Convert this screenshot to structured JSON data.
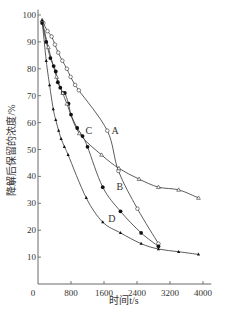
{
  "chart_data": {
    "type": "line",
    "title": "",
    "xlabel": "时间t/s",
    "ylabel": "降解后保留的浓度/%",
    "xlim": [
      0,
      4000
    ],
    "ylim": [
      0,
      100
    ],
    "x_ticks": [
      "0",
      "800",
      "1600",
      "2400",
      "3200",
      "4000"
    ],
    "y_ticks": [
      "10",
      "20",
      "30",
      "40",
      "50",
      "60",
      "70",
      "80",
      "90",
      "100"
    ],
    "grid": false,
    "legend": "inline labels",
    "series": [
      {
        "name": "A",
        "marker": "open-circle",
        "label_pos": [
          1780,
          57
        ],
        "points": [
          [
            130,
            97
          ],
          [
            230,
            94
          ],
          [
            330,
            92
          ],
          [
            410,
            89
          ],
          [
            490,
            86
          ],
          [
            590,
            83
          ],
          [
            700,
            80
          ],
          [
            790,
            77
          ],
          [
            900,
            74
          ],
          [
            990,
            72
          ],
          [
            1680,
            57
          ],
          [
            1950,
            42
          ],
          [
            2410,
            28
          ],
          [
            2920,
            15
          ]
        ]
      },
      {
        "name": "B",
        "marker": "filled-circle",
        "label_pos": [
          1900,
          36
        ],
        "points": [
          [
            100,
            97
          ],
          [
            200,
            90
          ],
          [
            300,
            84
          ],
          [
            380,
            81
          ],
          [
            430,
            79
          ],
          [
            480,
            75
          ],
          [
            540,
            73
          ],
          [
            600,
            71
          ],
          [
            650,
            71
          ],
          [
            740,
            67
          ],
          [
            800,
            63
          ],
          [
            950,
            58
          ],
          [
            1080,
            55
          ],
          [
            1200,
            51
          ],
          [
            1570,
            36
          ],
          [
            2000,
            27
          ],
          [
            2500,
            19
          ],
          [
            2920,
            14
          ]
        ]
      },
      {
        "name": "C",
        "marker": "open-triangle",
        "label_pos": [
          1150,
          57
        ],
        "points": [
          [
            100,
            98
          ],
          [
            250,
            88
          ],
          [
            450,
            77
          ],
          [
            600,
            71
          ],
          [
            700,
            67
          ],
          [
            1000,
            56
          ],
          [
            1540,
            48
          ],
          [
            1960,
            43
          ],
          [
            2450,
            39
          ],
          [
            2920,
            36
          ],
          [
            3410,
            35
          ],
          [
            3890,
            32
          ]
        ]
      },
      {
        "name": "D",
        "marker": "filled-triangle",
        "label_pos": [
          1700,
          24
        ],
        "points": [
          [
            100,
            98
          ],
          [
            200,
            83
          ],
          [
            280,
            74
          ],
          [
            370,
            65
          ],
          [
            430,
            61
          ],
          [
            500,
            57
          ],
          [
            560,
            54
          ],
          [
            640,
            51
          ],
          [
            730,
            48
          ],
          [
            1170,
            32
          ],
          [
            1570,
            23
          ],
          [
            2000,
            19
          ],
          [
            2500,
            15
          ],
          [
            2920,
            13
          ],
          [
            3410,
            12
          ],
          [
            3890,
            11
          ]
        ]
      }
    ]
  },
  "plot": {
    "origin_label": "0"
  }
}
